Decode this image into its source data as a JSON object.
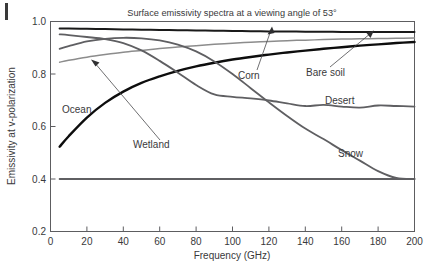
{
  "figure": {
    "title": "Surface emissivity spectra at a viewing angle of 53°",
    "xlabel": "Frequency (GHz)",
    "ylabel": "Emissivity at v-polarization"
  },
  "axes": {
    "x_ticks": [
      "0",
      "20",
      "40",
      "60",
      "80",
      "100",
      "120",
      "140",
      "160",
      "180",
      "200"
    ],
    "y_ticks": [
      "0.2",
      "0.4",
      "0.6",
      "0.8",
      "1.0"
    ]
  },
  "annotations": {
    "ocean": "Ocean",
    "wetland": "Wetland",
    "corn": "Corn",
    "bare_soil": "Bare soil",
    "desert": "Desert",
    "snow": "Snow"
  },
  "chart_data": {
    "type": "line",
    "title": "Surface emissivity spectra at a viewing angle of 53°",
    "xlabel": "Frequency (GHz)",
    "ylabel": "Emissivity at v-polarization",
    "xlim": [
      0,
      200
    ],
    "ylim": [
      0.2,
      1.0
    ],
    "xticks": [
      0,
      20,
      40,
      60,
      80,
      100,
      120,
      140,
      160,
      180,
      200
    ],
    "yticks": [
      0.2,
      0.4,
      0.6,
      0.8,
      1.0
    ],
    "grid": false,
    "legend": "inline-annotations",
    "x": [
      5,
      10,
      20,
      30,
      40,
      50,
      60,
      70,
      80,
      90,
      100,
      110,
      120,
      130,
      140,
      150,
      160,
      170,
      180,
      190,
      200
    ],
    "series": [
      {
        "name": "Corn",
        "color": "#1a1a1a",
        "width": 2.0,
        "values": [
          0.973,
          0.973,
          0.972,
          0.971,
          0.97,
          0.969,
          0.968,
          0.967,
          0.966,
          0.965,
          0.964,
          0.963,
          0.962,
          0.962,
          0.961,
          0.961,
          0.96,
          0.96,
          0.96,
          0.96,
          0.96
        ]
      },
      {
        "name": "Bare soil",
        "color": "#8c8c8c",
        "width": 1.5,
        "values": [
          0.845,
          0.852,
          0.864,
          0.874,
          0.883,
          0.89,
          0.897,
          0.903,
          0.908,
          0.913,
          0.917,
          0.921,
          0.924,
          0.927,
          0.929,
          0.931,
          0.933,
          0.934,
          0.935,
          0.936,
          0.937
        ]
      },
      {
        "name": "Ocean",
        "color": "#0d0d0d",
        "width": 2.4,
        "values": [
          0.523,
          0.563,
          0.634,
          0.69,
          0.733,
          0.766,
          0.791,
          0.812,
          0.829,
          0.843,
          0.855,
          0.865,
          0.874,
          0.882,
          0.889,
          0.896,
          0.902,
          0.908,
          0.913,
          0.918,
          0.922
        ]
      },
      {
        "name": "Wetland",
        "color": "#5f5f62",
        "width": 1.8,
        "values": [
          0.896,
          0.906,
          0.924,
          0.934,
          0.938,
          0.936,
          0.928,
          0.912,
          0.886,
          0.848,
          0.8,
          0.746,
          0.692,
          0.64,
          0.592,
          0.552,
          0.51,
          0.47,
          0.43,
          0.404,
          0.4
        ]
      },
      {
        "name": "Desert",
        "color": "#5f5f62",
        "width": 1.8,
        "values": [
          0.951,
          0.948,
          0.941,
          0.933,
          0.918,
          0.89,
          0.85,
          0.805,
          0.758,
          0.722,
          0.713,
          0.707,
          0.699,
          0.688,
          0.678,
          0.682,
          0.676,
          0.672,
          0.68,
          0.678,
          0.676
        ]
      },
      {
        "name": "Snow",
        "color": "#5f5f62",
        "width": 1.8,
        "values": [
          0.4,
          0.4,
          0.4,
          0.4,
          0.4,
          0.4,
          0.4,
          0.4,
          0.4,
          0.4,
          0.4,
          0.4,
          0.4,
          0.4,
          0.4,
          0.4,
          0.4,
          0.4,
          0.4,
          0.4,
          0.4
        ]
      }
    ]
  }
}
